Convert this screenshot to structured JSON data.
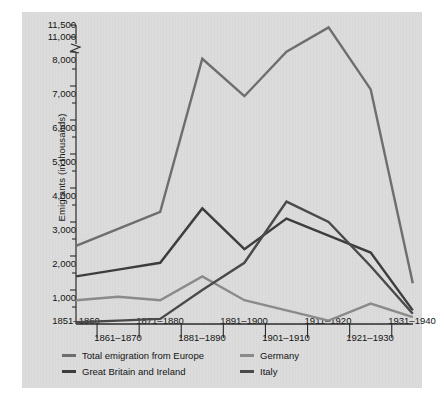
{
  "figure": {
    "background_color": "#dcdcdc",
    "axis_color": "#2b2b2b"
  },
  "chart_data": {
    "type": "line",
    "title": "",
    "xlabel": "",
    "ylabel": "Emigrants (in thousands)",
    "categories": [
      "1851–1860",
      "1861–1870",
      "1871–1880",
      "1881–1890",
      "1891–1900",
      "1901–1910",
      "1911–1920",
      "1921–1930",
      "1931–1940"
    ],
    "ytick_labels": [
      "11,500",
      "11,000",
      "8,000",
      "7,000",
      "6,000",
      "5,000",
      "4,000",
      "3,000",
      "2,000",
      "1,000"
    ],
    "ylim": [
      0,
      11500
    ],
    "axis_break": {
      "between": [
        11000,
        8000
      ],
      "note": "broken y-axis between 8,000 and 11,000"
    },
    "grid": false,
    "legend_position": "below-axis",
    "minor_ticks_every": 500,
    "series": [
      {
        "name": "Total emigration from Europe",
        "color": "#6e6e6e",
        "values": [
          2300,
          2800,
          3300,
          7800,
          6700,
          9100,
          11400,
          6900,
          1200
        ]
      },
      {
        "name": "Great Britain and Ireland",
        "color": "#3d3d3d",
        "values": [
          1400,
          1600,
          1800,
          3400,
          2200,
          3100,
          2600,
          2100,
          400
        ]
      },
      {
        "name": "Germany",
        "color": "#8a8a8a",
        "values": [
          700,
          800,
          700,
          1400,
          700,
          400,
          100,
          600,
          200
        ]
      },
      {
        "name": "Italy",
        "color": "#4a4a4a",
        "values": [
          50,
          100,
          150,
          1000,
          1800,
          3600,
          3000,
          1700,
          300
        ]
      }
    ]
  },
  "legend": {
    "entries": [
      {
        "label": "Total emigration from Europe",
        "color": "#6e6e6e"
      },
      {
        "label": "Great Britain and Ireland",
        "color": "#3d3d3d"
      },
      {
        "label": "Germany",
        "color": "#8a8a8a"
      },
      {
        "label": "Italy",
        "color": "#4a4a4a"
      }
    ]
  }
}
